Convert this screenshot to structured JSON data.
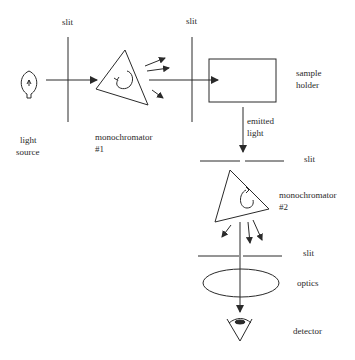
{
  "diagram": {
    "type": "fluorescence spectrometer schematic",
    "labels": {
      "slit1": "slit",
      "slit2": "slit",
      "light_source_line1": "light",
      "light_source_line2": "source",
      "mono1_line1": "monochromator",
      "mono1_line2": "#1",
      "sample_line1": "sample",
      "sample_line2": "holder",
      "emitted_line1": "emitted",
      "emitted_line2": "light",
      "slit3": "slit",
      "mono2_line1": "monochromator",
      "mono2_line2": "#2",
      "slit4": "slit",
      "optics": "optics",
      "detector": "detector"
    },
    "components": [
      {
        "id": "light-source",
        "icon": "lightbulb-icon"
      },
      {
        "id": "slit-1"
      },
      {
        "id": "monochromator-1",
        "icon": "triangle-prism-with-rotation-arrow"
      },
      {
        "id": "slit-2"
      },
      {
        "id": "sample-holder",
        "shape": "rectangle"
      },
      {
        "id": "slit-3"
      },
      {
        "id": "monochromator-2",
        "icon": "triangle-prism-with-rotation-arrow"
      },
      {
        "id": "slit-4"
      },
      {
        "id": "optics",
        "shape": "ellipse"
      },
      {
        "id": "detector",
        "icon": "eye-icon"
      }
    ],
    "stroke_color": "#2a2a2a"
  }
}
